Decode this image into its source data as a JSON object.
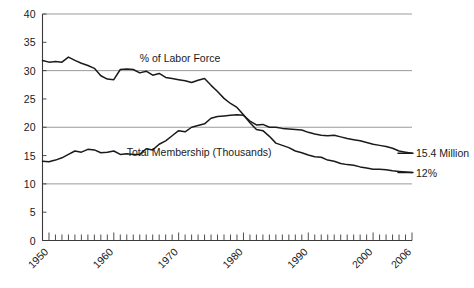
{
  "chart_data": {
    "type": "line",
    "title": "",
    "subtitle": "",
    "xlabel": "",
    "ylabel": "",
    "xlim": [
      1949,
      2006
    ],
    "ylim": [
      0,
      40
    ],
    "grid": true,
    "gridlines_y": [
      10,
      20,
      30,
      40
    ],
    "legend_position": "inline-annotation",
    "y_ticks": [
      0,
      5,
      10,
      15,
      20,
      25,
      30,
      35,
      40
    ],
    "y_tick_labels": [
      "0",
      "5",
      "10",
      "15",
      "20",
      "25",
      "30",
      "35",
      "40"
    ],
    "x_ticks_labeled": [
      1950,
      1960,
      1970,
      1980,
      1990,
      2000,
      2006
    ],
    "x_tick_labels": [
      "1950",
      "1960",
      "1970",
      "1980",
      "1990",
      "2000",
      "2006"
    ],
    "x_minor_tick_interval": 1,
    "annotations": [
      {
        "name": "labor-force-annotation",
        "text": "% of Labor Force",
        "x": 1964,
        "y": 32.2
      },
      {
        "name": "membership-annotation",
        "text": "Total Membership (Thousands)",
        "x": 1962,
        "y": 15.6
      },
      {
        "name": "membership-end-label",
        "text": "15.4 Million",
        "x": 2007,
        "y": 15.4
      },
      {
        "name": "labor-force-end-label",
        "text": "12%",
        "x": 2007,
        "y": 12.0
      }
    ],
    "series": [
      {
        "name": "% of Labor Force",
        "color": "#1a1a1a",
        "x": [
          1949,
          1950,
          1951,
          1952,
          1953,
          1954,
          1955,
          1956,
          1957,
          1958,
          1959,
          1960,
          1961,
          1962,
          1963,
          1964,
          1965,
          1966,
          1967,
          1968,
          1969,
          1970,
          1971,
          1972,
          1973,
          1974,
          1975,
          1976,
          1977,
          1978,
          1979,
          1980,
          1981,
          1982,
          1983,
          1984,
          1985,
          1986,
          1987,
          1988,
          1989,
          1990,
          1991,
          1992,
          1993,
          1994,
          1995,
          1996,
          1997,
          1998,
          1999,
          2000,
          2001,
          2002,
          2003,
          2004,
          2005,
          2006
        ],
        "values": [
          31.8,
          31.5,
          31.6,
          31.5,
          32.4,
          31.8,
          31.3,
          30.9,
          30.4,
          29.1,
          28.5,
          28.4,
          30.2,
          30.3,
          30.2,
          29.6,
          29.9,
          29.2,
          29.5,
          28.8,
          28.6,
          28.4,
          28.2,
          27.9,
          28.3,
          28.6,
          27.4,
          26.3,
          25.1,
          24.2,
          23.5,
          22.2,
          20.8,
          19.6,
          19.4,
          18.4,
          17.2,
          16.8,
          16.4,
          15.8,
          15.5,
          15.1,
          14.8,
          14.7,
          14.2,
          14.0,
          13.6,
          13.4,
          13.3,
          13.0,
          12.8,
          12.6,
          12.6,
          12.5,
          12.3,
          12.2,
          12.1,
          12.0
        ]
      },
      {
        "name": "Total Membership (Thousands)",
        "color": "#1a1a1a",
        "x": [
          1949,
          1950,
          1951,
          1952,
          1953,
          1954,
          1955,
          1956,
          1957,
          1958,
          1959,
          1960,
          1961,
          1962,
          1963,
          1964,
          1965,
          1966,
          1967,
          1968,
          1969,
          1970,
          1971,
          1972,
          1973,
          1974,
          1975,
          1976,
          1977,
          1978,
          1979,
          1980,
          1981,
          1982,
          1983,
          1984,
          1985,
          1986,
          1987,
          1988,
          1989,
          1990,
          1991,
          1992,
          1993,
          1994,
          1995,
          1996,
          1997,
          1998,
          1999,
          2000,
          2001,
          2002,
          2003,
          2004,
          2005,
          2006
        ],
        "values": [
          14.0,
          13.9,
          14.2,
          14.6,
          15.2,
          15.8,
          15.6,
          16.1,
          16.0,
          15.5,
          15.6,
          15.8,
          15.2,
          15.3,
          15.2,
          15.2,
          16.2,
          16.0,
          17.0,
          17.6,
          18.5,
          19.4,
          19.2,
          20.0,
          20.3,
          20.6,
          21.6,
          21.9,
          22.0,
          22.1,
          22.2,
          22.1,
          21.1,
          20.4,
          20.5,
          20.0,
          20.0,
          19.8,
          19.7,
          19.6,
          19.5,
          19.1,
          18.8,
          18.6,
          18.5,
          18.6,
          18.3,
          18.0,
          17.8,
          17.6,
          17.3,
          17.0,
          16.8,
          16.6,
          16.3,
          15.8,
          15.6,
          15.4
        ]
      }
    ]
  }
}
